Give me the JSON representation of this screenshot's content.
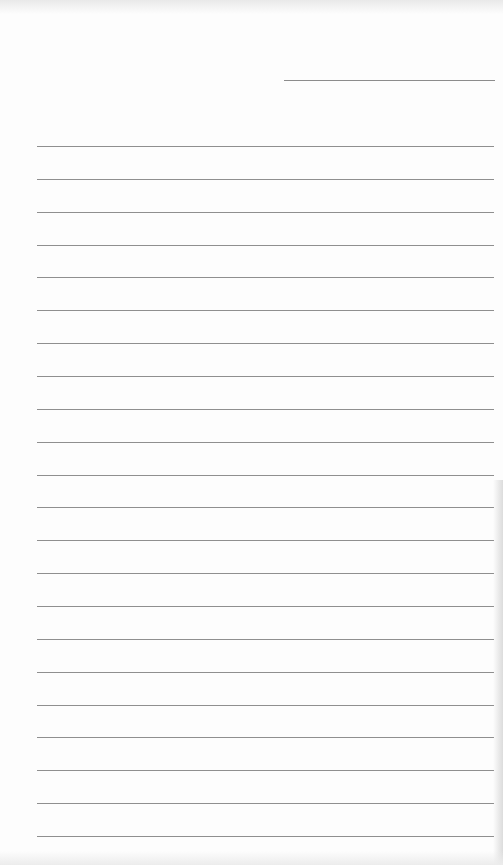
{
  "document": {
    "type": "lined-paper",
    "header_rule": {
      "visible": true
    },
    "ruled_lines": {
      "count": 22,
      "first_y": 146,
      "spacing": 32.86,
      "color": "#8f8f8f"
    },
    "text_content": []
  }
}
